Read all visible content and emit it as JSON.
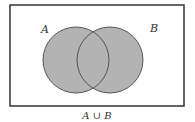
{
  "diagram": {
    "type": "venn",
    "universe": {
      "x": 10,
      "y": 5,
      "width": 174,
      "height": 101
    },
    "sets": [
      {
        "label": "A",
        "cx": 76,
        "cy": 60,
        "r": 33
      },
      {
        "label": "B",
        "cx": 110,
        "cy": 60,
        "r": 33
      }
    ],
    "shaded": "A ∪ B",
    "caption": "A ∪ B",
    "colors": {
      "fill": "#b3b3b3",
      "stroke": "#555555",
      "border": "#333333"
    }
  }
}
